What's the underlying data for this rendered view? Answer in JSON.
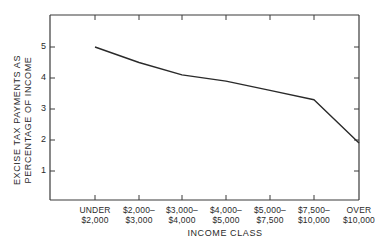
{
  "chart_data": {
    "type": "line",
    "title": "",
    "xlabel": "INCOME CLASS",
    "ylabel": "EXCISE TAX PAYMENTS AS PERCENTAGE OF INCOME",
    "ylabel_lines": [
      "EXCISE TAX PAYMENTS AS",
      "PERCENTAGE OF INCOME"
    ],
    "categories": [
      [
        "UNDER",
        "$2,000"
      ],
      [
        "$2,000–",
        "$3,000"
      ],
      [
        "$3,000–",
        "$4,000"
      ],
      [
        "$4,000–",
        "$5,000"
      ],
      [
        "$5,000–",
        "$7,500"
      ],
      [
        "$7,500–",
        "$10,000"
      ],
      [
        "OVER",
        "$10,000"
      ]
    ],
    "category_labels": [
      "UNDER $2,000",
      "$2,000–$3,000",
      "$3,000–$4,000",
      "$4,000–$5,000",
      "$5,000–$7,500",
      "$7,500–$10,000",
      "OVER $10,000"
    ],
    "values": [
      5.0,
      4.5,
      4.1,
      3.9,
      3.6,
      3.3,
      1.9
    ],
    "yticks": [
      "1",
      "2",
      "3",
      "4",
      "5"
    ],
    "ylim": [
      0,
      6
    ],
    "grid": false,
    "legend": null,
    "line_color": "#2a2a2a"
  }
}
